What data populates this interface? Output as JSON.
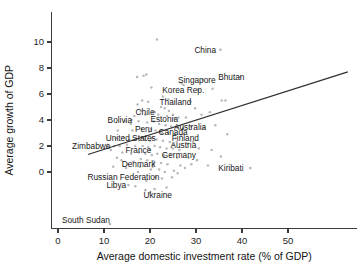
{
  "chart_data": {
    "type": "scatter",
    "title": "",
    "xlabel": "Average domestic investment rate (% of GDP)",
    "ylabel": "Average growth of GDP",
    "xlim": [
      -2,
      64
    ],
    "ylim": [
      -4.6,
      11.6
    ],
    "xticks": [
      0,
      10,
      20,
      30,
      40,
      50
    ],
    "yticks": [
      0,
      2,
      4,
      6,
      8,
      10
    ],
    "grid": false,
    "legend": "none",
    "point_color": "#b9b9b9",
    "line_color": "#2e2e2e",
    "trendline": {
      "label": "linear fit",
      "x0": 6.5,
      "y0": 1.35,
      "x1": 63.0,
      "y1": 7.7
    },
    "labeled_points": [
      {
        "name": "China",
        "x": 35.3,
        "y": 9.4,
        "label_dx": -26,
        "label_dy": 3.0
      },
      {
        "name": "Singapore",
        "x": 31.5,
        "y": 7.1,
        "label_dx": -25,
        "label_dy": 3.0
      },
      {
        "name": "Bhutan",
        "x": 39.6,
        "y": 7.3,
        "label_dx": -22,
        "label_dy": 3.0
      },
      {
        "name": "Korea Rep.",
        "x": 30.5,
        "y": 6.3,
        "label_dx": -36,
        "label_dy": 3.0
      },
      {
        "name": "Thailand",
        "x": 28.8,
        "y": 5.4,
        "label_dx": -31,
        "label_dy": 3.0
      },
      {
        "name": "Chile",
        "x": 21.0,
        "y": 4.6,
        "label_dx": -19,
        "label_dy": 3.0
      },
      {
        "name": "Estonia",
        "x": 25.3,
        "y": 4.1,
        "label_dx": -24,
        "label_dy": 3.0
      },
      {
        "name": "Bolivia",
        "x": 16.0,
        "y": 4.0,
        "label_dx": -24,
        "label_dy": 3.0
      },
      {
        "name": "Australia",
        "x": 28.9,
        "y": 3.5,
        "label_dx": -17,
        "label_dy": 3.0
      },
      {
        "name": "Peru",
        "x": 20.2,
        "y": 3.3,
        "label_dx": -16,
        "label_dy": 3.0
      },
      {
        "name": "Canada",
        "x": 22.3,
        "y": 3.1,
        "label_dx": -2,
        "label_dy": 3.0
      },
      {
        "name": "United States",
        "x": 20.4,
        "y": 2.6,
        "label_dx": -46,
        "label_dy": 3.0
      },
      {
        "name": "Finland",
        "x": 25.6,
        "y": 2.6,
        "label_dx": -4,
        "label_dy": 3.0
      },
      {
        "name": "Zimbabwe",
        "x": 12.2,
        "y": 2.0,
        "label_dx": -42,
        "label_dy": 3.0
      },
      {
        "name": "Austria",
        "x": 25.1,
        "y": 2.1,
        "label_dx": -3,
        "label_dy": 3.0
      },
      {
        "name": "France",
        "x": 19.9,
        "y": 1.7,
        "label_dx": -24,
        "label_dy": 3.0
      },
      {
        "name": "Germany",
        "x": 23.0,
        "y": 1.3,
        "label_dx": -2,
        "label_dy": 3.0
      },
      {
        "name": "Denmark",
        "x": 20.8,
        "y": 0.6,
        "label_dx": -32,
        "label_dy": 3.0
      },
      {
        "name": "Kiribati",
        "x": 41.8,
        "y": 0.3,
        "label_dx": -32,
        "label_dy": 3.0
      },
      {
        "name": "Russian Federation",
        "x": 21.2,
        "y": -0.4,
        "label_dx": -68,
        "label_dy": 3.0
      },
      {
        "name": "Libya",
        "x": 15.3,
        "y": -1.0,
        "label_dx": -22,
        "label_dy": 3.0
      },
      {
        "name": "Ukraine",
        "x": 19.0,
        "y": -1.4,
        "label_dx": -2,
        "label_dy": 8.0
      },
      {
        "name": "South Sudan",
        "x": 11.3,
        "y": -4.0,
        "label_dx": -48,
        "label_dy": -1.5
      }
    ],
    "unlabeled_points": [
      [
        21.5,
        10.2
      ],
      [
        17.2,
        7.3
      ],
      [
        19.2,
        7.5
      ],
      [
        18.6,
        7.4
      ],
      [
        20.3,
        6.5
      ],
      [
        27.3,
        6.7
      ],
      [
        26.9,
        6.8
      ],
      [
        33.6,
        6.4
      ],
      [
        35.6,
        5.5
      ],
      [
        36.4,
        5.5
      ],
      [
        18.3,
        5.5
      ],
      [
        19.6,
        5.4
      ],
      [
        17.3,
        5.2
      ],
      [
        22.4,
        5.0
      ],
      [
        23.2,
        4.9
      ],
      [
        24.1,
        4.7
      ],
      [
        20.6,
        4.6
      ],
      [
        21.8,
        4.4
      ],
      [
        19.0,
        4.4
      ],
      [
        18.0,
        4.7
      ],
      [
        16.6,
        4.3
      ],
      [
        23.7,
        4.3
      ],
      [
        25.0,
        4.4
      ],
      [
        26.2,
        4.2
      ],
      [
        27.8,
        4.2
      ],
      [
        33.0,
        4.6
      ],
      [
        14.6,
        3.9
      ],
      [
        15.8,
        3.7
      ],
      [
        17.5,
        3.9
      ],
      [
        19.4,
        3.8
      ],
      [
        20.8,
        3.9
      ],
      [
        22.0,
        3.7
      ],
      [
        23.4,
        3.6
      ],
      [
        24.6,
        3.5
      ],
      [
        26.0,
        3.4
      ],
      [
        27.2,
        3.4
      ],
      [
        31.8,
        3.4
      ],
      [
        13.0,
        3.2
      ],
      [
        16.2,
        3.2
      ],
      [
        18.2,
        3.3
      ],
      [
        19.8,
        3.1
      ],
      [
        21.2,
        3.2
      ],
      [
        22.6,
        3.0
      ],
      [
        24.0,
        3.0
      ],
      [
        25.4,
        2.9
      ],
      [
        26.8,
        2.8
      ],
      [
        12.6,
        2.6
      ],
      [
        14.2,
        2.7
      ],
      [
        15.5,
        2.5
      ],
      [
        17.0,
        2.6
      ],
      [
        18.8,
        2.5
      ],
      [
        20.0,
        2.4
      ],
      [
        21.4,
        2.5
      ],
      [
        22.8,
        2.4
      ],
      [
        24.3,
        2.3
      ],
      [
        25.8,
        2.3
      ],
      [
        28.2,
        2.2
      ],
      [
        29.4,
        2.3
      ],
      [
        13.4,
        2.0
      ],
      [
        15.0,
        2.1
      ],
      [
        16.8,
        2.0
      ],
      [
        18.4,
        2.0
      ],
      [
        19.6,
        1.9
      ],
      [
        21.0,
        2.0
      ],
      [
        22.2,
        1.9
      ],
      [
        23.6,
        1.8
      ],
      [
        25.0,
        1.8
      ],
      [
        26.4,
        1.7
      ],
      [
        30.6,
        1.8
      ],
      [
        33.4,
        1.7
      ],
      [
        14.0,
        1.5
      ],
      [
        15.9,
        1.4
      ],
      [
        17.6,
        1.5
      ],
      [
        19.0,
        1.4
      ],
      [
        20.4,
        1.3
      ],
      [
        21.6,
        1.4
      ],
      [
        23.0,
        1.2
      ],
      [
        24.4,
        1.3
      ],
      [
        25.9,
        1.1
      ],
      [
        35.4,
        1.2
      ],
      [
        13.8,
        0.9
      ],
      [
        16.4,
        0.8
      ],
      [
        18.0,
        1.0
      ],
      [
        19.4,
        0.9
      ],
      [
        20.9,
        0.8
      ],
      [
        22.4,
        0.7
      ],
      [
        23.8,
        0.6
      ],
      [
        26.6,
        0.5
      ],
      [
        29.0,
        0.6
      ],
      [
        12.0,
        0.4
      ],
      [
        14.8,
        0.3
      ],
      [
        17.8,
        0.4
      ],
      [
        20.2,
        0.2
      ],
      [
        22.0,
        0.2
      ],
      [
        23.2,
        0.0
      ],
      [
        25.2,
        0.1
      ],
      [
        27.6,
        0.3
      ],
      [
        32.6,
        0.5
      ],
      [
        11.5,
        1.7
      ],
      [
        10.8,
        2.1
      ],
      [
        24.8,
        -0.4
      ],
      [
        22.6,
        -0.5
      ],
      [
        19.2,
        -0.7
      ],
      [
        16.8,
        -1.1
      ],
      [
        21.0,
        -1.3
      ],
      [
        23.6,
        -1.2
      ],
      [
        20.0,
        -1.6
      ],
      [
        17.4,
        0.0
      ],
      [
        15.2,
        0.6
      ],
      [
        28.4,
        1.1
      ],
      [
        30.2,
        0.9
      ],
      [
        26.0,
        -0.1
      ],
      [
        12.8,
        1.1
      ],
      [
        24.0,
        5.6
      ],
      [
        22.8,
        5.8
      ],
      [
        29.8,
        4.9
      ],
      [
        31.2,
        4.4
      ],
      [
        34.2,
        3.6
      ],
      [
        36.8,
        2.9
      ],
      [
        20.6,
        0.4
      ]
    ]
  },
  "axes": {
    "x_tick_labels": [
      "0",
      "10",
      "20",
      "30",
      "40",
      "50"
    ],
    "y_tick_labels": [
      "10",
      "8",
      "6",
      "4",
      "2",
      "0"
    ]
  }
}
